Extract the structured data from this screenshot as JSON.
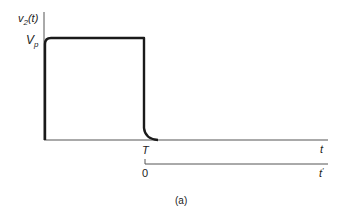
{
  "figure": {
    "y_axis_label": "v",
    "y_axis_label_sub": "2",
    "y_axis_label_arg": "(t)",
    "amplitude_label": "V",
    "amplitude_label_sub": "p",
    "x_axis_label": "t",
    "pulse_end_label": "T",
    "shifted_axis_origin_label": "0",
    "shifted_axis_label": "t",
    "shifted_axis_prime": "′",
    "caption": "(a)"
  },
  "colors": {
    "line": "#1a1a1a",
    "thin_line": "#555555",
    "background": "#ffffff"
  }
}
